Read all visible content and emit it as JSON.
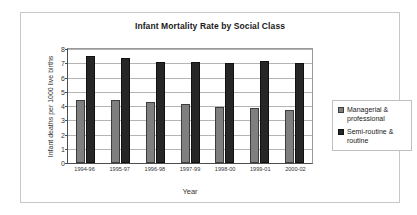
{
  "chart_data": {
    "type": "bar",
    "title": "Infant Mortality Rate by Social Class",
    "xlabel": "Year",
    "ylabel": "Infant deaths per 1000 live births",
    "categories": [
      "1994-96",
      "1995-97",
      "1996-98",
      "1997-99",
      "1998-00",
      "1999-01",
      "2000-02"
    ],
    "series": [
      {
        "name": "Managerial & professional",
        "color": "#7f7f7f",
        "values": [
          4.4,
          4.45,
          4.25,
          4.15,
          3.95,
          3.85,
          3.7
        ]
      },
      {
        "name": "Semi-routine & routine",
        "color": "#262626",
        "values": [
          7.5,
          7.4,
          7.1,
          7.1,
          7.0,
          7.15,
          7.0
        ]
      }
    ],
    "ylim": [
      0,
      8
    ],
    "yticks": [
      0,
      1,
      2,
      3,
      4,
      5,
      6,
      7,
      8
    ],
    "grid": true,
    "legend_position": "right"
  }
}
